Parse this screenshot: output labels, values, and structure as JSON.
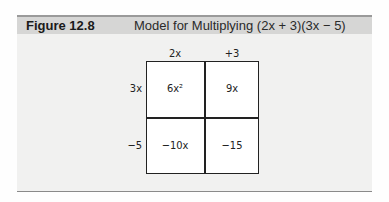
{
  "figure": {
    "label": "Figure 12.8",
    "title": "Model for Multiplying (2x + 3)(3x − 5)"
  },
  "grid": {
    "column_headers": [
      "2x",
      "+3"
    ],
    "row_headers": [
      "3x",
      "−5"
    ],
    "cells": [
      [
        "6x²",
        "9x"
      ],
      [
        "−10x",
        "−15"
      ]
    ]
  }
}
